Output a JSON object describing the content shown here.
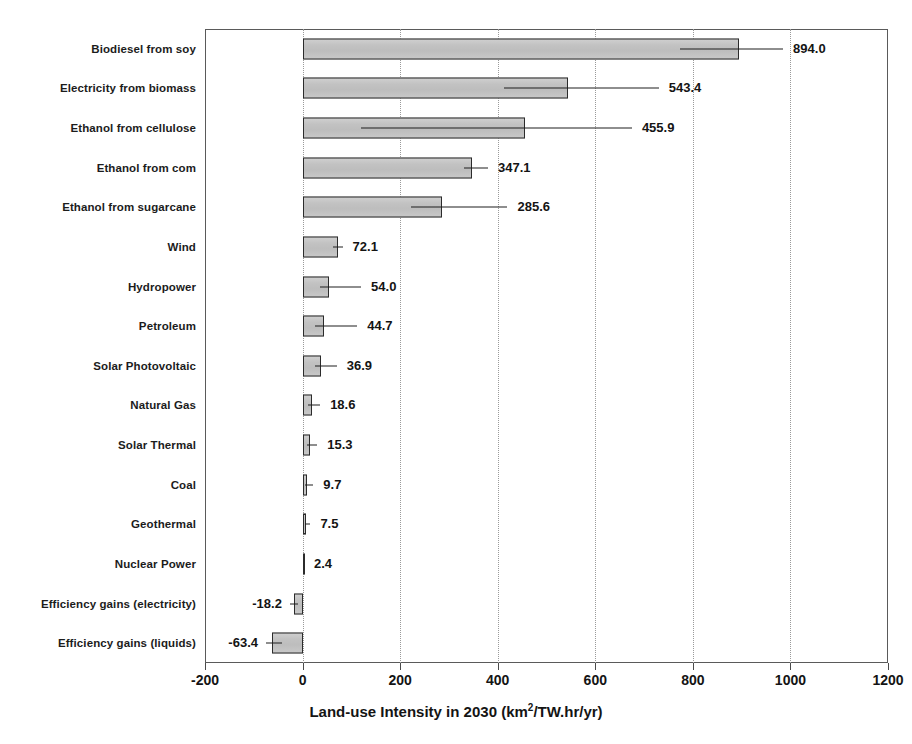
{
  "chart_data": {
    "type": "bar",
    "orientation": "horizontal",
    "title": "",
    "xlabel": "Land-use Intensity in 2030 (km²/TW.hr/yr)",
    "xlabel_prefix": "Land-use Intensity in 2030 (km",
    "xlabel_sup": "2",
    "xlabel_suffix": "/TW.hr/yr)",
    "ylabel": "",
    "xlim": [
      -200,
      1200
    ],
    "xticks": [
      -200,
      0,
      200,
      400,
      600,
      800,
      1000,
      1200
    ],
    "xticklabels": [
      "-200",
      "0",
      "200",
      "400",
      "600",
      "800",
      "1000",
      "1200"
    ],
    "grid": "vertical-dotted",
    "legend": "none",
    "categories": [
      "Biodiesel from soy",
      "Electricity from biomass",
      "Ethanol from cellulose",
      "Ethanol from com",
      "Ethanol from sugarcane",
      "Wind",
      "Hydropower",
      "Petroleum",
      "Solar Photovoltaic",
      "Natural Gas",
      "Solar Thermal",
      "Coal",
      "Geothermal",
      "Nuclear Power",
      "Efficiency gains (electricity)",
      "Efficiency gains (liquids)"
    ],
    "values": [
      894.0,
      543.4,
      455.9,
      347.1,
      285.6,
      72.1,
      54.0,
      44.7,
      36.9,
      18.6,
      15.3,
      9.7,
      7.5,
      2.4,
      -18.2,
      -63.4
    ],
    "value_labels": [
      "894.0",
      "543.4",
      "455.9",
      "347.1",
      "285.6",
      "72.1",
      "54.0",
      "44.7",
      "36.9",
      "18.6",
      "15.3",
      "9.7",
      "7.5",
      "2.4",
      "-18.2",
      "-63.4"
    ],
    "error_low": [
      774,
      413,
      120,
      330,
      223,
      63,
      36,
      26,
      25,
      11,
      9,
      5,
      4,
      2,
      -26,
      -75
    ],
    "error_high": [
      985,
      730,
      675,
      380,
      420,
      82,
      120,
      112,
      70,
      36,
      30,
      22,
      16,
      3,
      -10,
      -43
    ],
    "colors": {
      "bar_fill": "#c4c4c4",
      "bar_edge": "#2b2b2b",
      "error_bar": "#1f1f1f",
      "grid": "#9a9a9a",
      "frame": "#5a5a5a",
      "text": "#141414",
      "background": "#ffffff"
    }
  }
}
